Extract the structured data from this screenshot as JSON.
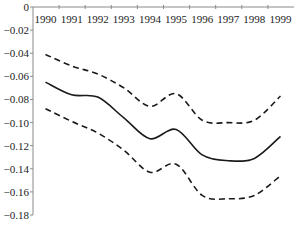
{
  "chart_data": {
    "type": "line",
    "title": "",
    "xlabel": "",
    "ylabel": "",
    "categories": [
      "1990",
      "1991",
      "1992",
      "1993",
      "1994",
      "1995",
      "1996",
      "1997",
      "1998",
      "1999"
    ],
    "ylim": [
      -0.18,
      0
    ],
    "yticks": [
      "0",
      "-0.02",
      "-0.04",
      "-0.06",
      "-0.08",
      "-0.10",
      "-0.12",
      "-0.14",
      "-0.16",
      "-0.18"
    ],
    "ytick_values": [
      0,
      -0.02,
      -0.04,
      -0.06,
      -0.08,
      -0.1,
      -0.12,
      -0.14,
      -0.16,
      -0.18
    ],
    "x_axis_position": "top",
    "grid": false,
    "legend": null,
    "series": [
      {
        "name": "upper bound",
        "style": "dashed",
        "color": "#1a1a1a",
        "values": [
          -0.041,
          -0.051,
          -0.058,
          -0.07,
          -0.086,
          -0.075,
          -0.098,
          -0.1,
          -0.098,
          -0.077
        ]
      },
      {
        "name": "estimate",
        "style": "solid",
        "color": "#1a1a1a",
        "values": [
          -0.065,
          -0.076,
          -0.078,
          -0.096,
          -0.114,
          -0.106,
          -0.128,
          -0.133,
          -0.131,
          -0.112
        ]
      },
      {
        "name": "lower bound",
        "style": "dashed",
        "color": "#1a1a1a",
        "values": [
          -0.088,
          -0.099,
          -0.109,
          -0.124,
          -0.143,
          -0.136,
          -0.163,
          -0.166,
          -0.163,
          -0.146
        ]
      }
    ]
  }
}
